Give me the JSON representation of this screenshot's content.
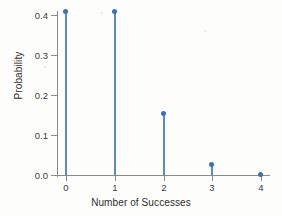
{
  "chart_data": {
    "type": "line",
    "plot_style": "stem",
    "title": "",
    "subtitle": "",
    "xlabel": "Number of Successes",
    "ylabel": "Probability",
    "x": [
      0,
      1,
      2,
      3,
      4
    ],
    "categories": [
      "0",
      "1",
      "2",
      "3",
      "4"
    ],
    "values": [
      0.41,
      0.41,
      0.154,
      0.026,
      0.002
    ],
    "series": [
      {
        "name": "Probability",
        "values": [
          0.41,
          0.41,
          0.154,
          0.026,
          0.002
        ]
      }
    ],
    "xlim": [
      -0.35,
      4.35
    ],
    "ylim": [
      0.0,
      0.4325
    ],
    "ytick_labels": [
      "0.0",
      "0.1",
      "0.2",
      "0.3",
      "0.4"
    ],
    "ytick_values": [
      0.0,
      0.1,
      0.2,
      0.3,
      0.4
    ],
    "xtick_labels": [
      "0",
      "1",
      "2",
      "3",
      "4"
    ],
    "xtick_values": [
      0,
      1,
      2,
      3,
      4
    ],
    "grid": false,
    "legend": false,
    "legend_position": "none",
    "annotations": [],
    "colors": {
      "marker": "#3f6fb5",
      "stem": "#5b8ac7",
      "axis": "#8a8a8a",
      "text": "#2e2e2e",
      "background": "#fdfdfc"
    }
  }
}
